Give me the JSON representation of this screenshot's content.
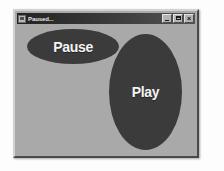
{
  "window": {
    "title": "Paused...",
    "sysmenu_icon": "system-menu-icon",
    "controls": [
      {
        "name": "minimize",
        "label": "_"
      },
      {
        "name": "maximize",
        "label": "□"
      },
      {
        "name": "close",
        "label": "×"
      }
    ]
  },
  "client": {
    "background_color": "#a9a9a9",
    "buttons": [
      {
        "id": "pause",
        "label": "Pause",
        "shape": "ellipse",
        "fill_color": "#3b3b3b",
        "text_color": "#f4f4f4"
      },
      {
        "id": "play",
        "label": "Play",
        "shape": "ellipse",
        "fill_color": "#3b3b3b",
        "text_color": "#f4f4f4"
      }
    ]
  },
  "colors": {
    "titlebar_start": "#232323",
    "titlebar_end": "#545454",
    "window_face": "#a9a9a9",
    "page_background": "#fdfdfd"
  }
}
